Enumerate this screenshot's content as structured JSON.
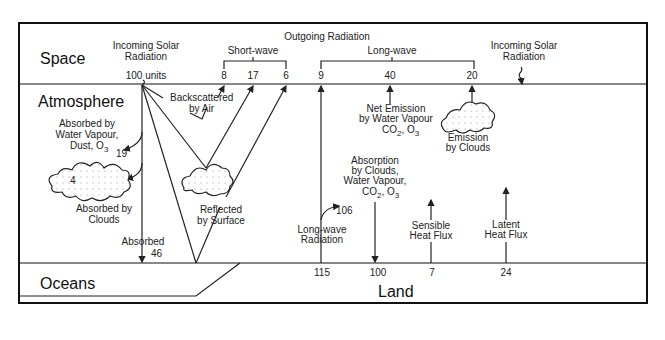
{
  "regions": {
    "space": "Space",
    "atmosphere": "Atmosphere",
    "oceans": "Oceans",
    "land": "Land"
  },
  "top": {
    "incoming_solar": [
      "Incoming Solar",
      "Radiation"
    ],
    "incoming_units": "100 units",
    "outgoing_radiation": "Outgoing Radiation",
    "short_wave": "Short-wave",
    "long_wave": "Long-wave",
    "short_wave_values": [
      "8",
      "17",
      "6"
    ],
    "long_wave_values": [
      "9",
      "40",
      "20"
    ],
    "incoming_solar_right": [
      "Incoming Solar",
      "Radiation"
    ]
  },
  "atmosphere": {
    "backscattered": [
      "Backscattered",
      "by Air"
    ],
    "absorbed_water": [
      "Absorbed by",
      "Water Vapour,",
      "Dust, O",
      "3"
    ],
    "absorbed_water_value": "19",
    "cloud_value": "4",
    "absorbed_clouds": [
      "Absorbed by",
      "Clouds"
    ],
    "reflected_surface": [
      "Reflected",
      "by Surface"
    ],
    "absorbed": "Absorbed",
    "absorbed_value": "46",
    "net_emission": [
      "Net Emission",
      "by Water Vapour",
      "CO",
      "2",
      ", O",
      "3"
    ],
    "emission_clouds": [
      "Emission",
      "by Clouds"
    ],
    "absorption_clouds": [
      "Absorption",
      "by Clouds,",
      "Water Vapour,",
      "CO",
      "2",
      ", O",
      "3"
    ],
    "lw_value_106": "106",
    "long_wave_radiation": [
      "Long-wave",
      "Radiation"
    ],
    "sensible": [
      "Sensible",
      "Heat Flux"
    ],
    "latent": [
      "Latent",
      "Heat Flux"
    ]
  },
  "surface_values": [
    "115",
    "100",
    "7",
    "24"
  ]
}
